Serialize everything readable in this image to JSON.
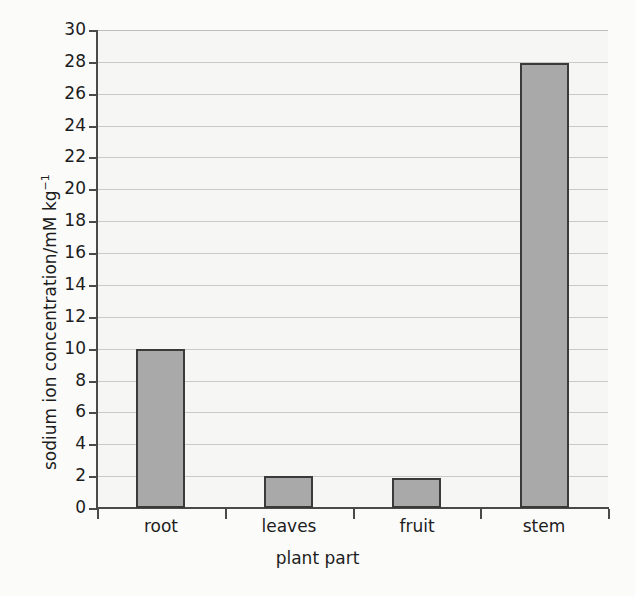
{
  "chart_data": {
    "type": "bar",
    "title": "",
    "xlabel": "plant part",
    "ylabel": "sodium ion concentration/mM kg",
    "ylabel_exponent": "−1",
    "categories": [
      "root",
      "leaves",
      "fruit",
      "stem"
    ],
    "values": [
      10.0,
      2.0,
      1.9,
      27.9
    ],
    "series": [
      {
        "name": "sodium ion concentration",
        "values": [
          10.0,
          2.0,
          1.9,
          27.9
        ]
      }
    ],
    "ylim": [
      0,
      30
    ],
    "ytick_step": 2,
    "ytick_labels": [
      "0",
      "2",
      "4",
      "6",
      "8",
      "10",
      "12",
      "14",
      "16",
      "18",
      "20",
      "22",
      "24",
      "26",
      "28",
      "30"
    ],
    "grid": "horizontal",
    "legend": "none",
    "colors": {
      "bar_fill": "#a9a9a9",
      "bar_border": "#3a3a3a",
      "gridline": "#c9c9c9",
      "axis": "#4a4a4a",
      "plot_background": "#f6f6f4",
      "page_background": "#fbfbfa",
      "text": "#1d1d1d"
    }
  }
}
